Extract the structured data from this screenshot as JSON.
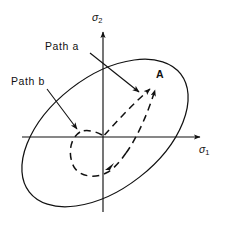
{
  "figure": {
    "kind": "yield-surface-stress-path-diagram",
    "background_color": "#ffffff",
    "line_color": "#111111",
    "axes": {
      "x_label": "σ",
      "x_label_sub": "1",
      "y_label": "σ",
      "y_label_sub": "2",
      "origin": {
        "x": 103,
        "y": 137
      },
      "x_axis": {
        "from_x": 22,
        "to_x": 207,
        "y": 137,
        "arrow": "right"
      },
      "y_axis": {
        "x": 103,
        "from_y": 212,
        "to_y": 26,
        "arrow": "up"
      }
    },
    "annotations": {
      "path_a_label": "Path a",
      "path_b_label": "Path b",
      "point_label": "A"
    },
    "yield_surface": {
      "type": "ellipse",
      "center_x": 105,
      "center_y": 133,
      "semi_major": 96,
      "semi_minor": 56,
      "rotation_deg": -38,
      "style": "solid"
    },
    "paths": [
      {
        "name": "Path a",
        "style": "dashed",
        "from": "origin",
        "to": "A",
        "description": "direct dashed path from origin up-right to point A"
      },
      {
        "name": "Path b",
        "style": "dashed",
        "from": "origin",
        "to": "A",
        "description": "dashed loop leaving origin leftward, looping below-left, then sweeping up-right to point A"
      }
    ],
    "point_a": {
      "x": 158,
      "y": 84
    }
  }
}
